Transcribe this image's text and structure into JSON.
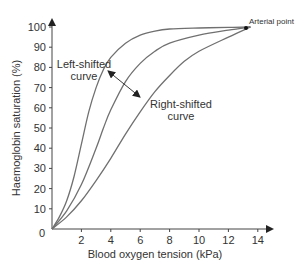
{
  "chart_data": {
    "type": "line",
    "title": "",
    "xlabel": "Blood oxygen tension (kPa)",
    "ylabel": "Haemoglobin saturation (%)",
    "xlim": [
      0,
      14
    ],
    "ylim": [
      0,
      100
    ],
    "x_ticks": [
      0,
      2,
      4,
      6,
      8,
      10,
      12,
      14
    ],
    "x_tick_labels": [
      "2",
      "4",
      "6",
      "8",
      "10",
      "12",
      "14"
    ],
    "y_ticks": [
      0,
      10,
      20,
      30,
      40,
      50,
      60,
      70,
      80,
      90,
      100
    ],
    "y_tick_labels": [
      "0",
      "10",
      "20",
      "30",
      "40",
      "50",
      "60",
      "70",
      "80",
      "90",
      "100"
    ],
    "grid": false,
    "legend": null,
    "series": [
      {
        "name": "Left-shifted curve",
        "x": [
          0,
          0.5,
          1,
          1.5,
          2,
          2.5,
          3,
          3.5,
          4,
          5,
          6,
          7,
          8,
          10,
          12,
          13.5
        ],
        "values": [
          0,
          6,
          14,
          26,
          42,
          58,
          70,
          79,
          85,
          92,
          96,
          98,
          99,
          99.5,
          99.8,
          100
        ]
      },
      {
        "name": "Normal curve",
        "x": [
          0,
          1,
          2,
          3,
          3.5,
          4,
          5,
          6,
          7,
          8,
          10,
          12,
          13.5
        ],
        "values": [
          0,
          9,
          22,
          40,
          50,
          59,
          73,
          82,
          88,
          92,
          96,
          98.5,
          100
        ]
      },
      {
        "name": "Right-shifted curve",
        "x": [
          0,
          1,
          2,
          3,
          4,
          5,
          6,
          7,
          8,
          9,
          10,
          12,
          13.5
        ],
        "values": [
          0,
          6,
          14,
          24,
          35,
          47,
          58,
          68,
          76,
          83,
          88,
          95,
          100
        ]
      }
    ],
    "annotations": [
      {
        "text": "Left-shifted curve",
        "points_to": "left curve"
      },
      {
        "text": "Right-shifted curve",
        "points_to": "right curve"
      },
      {
        "text": "Arterial point",
        "x": 13.3,
        "y": 100
      }
    ]
  },
  "labels": {
    "x_axis_title": "Blood oxygen tension (kPa)",
    "y_axis_title": "Haemoglobin saturation (%)",
    "left_shift_line1": "Left-shifted",
    "left_shift_line2": "curve",
    "right_shift_line1": "Right-shifted",
    "right_shift_line2": "curve",
    "arterial_point": "Arterial point",
    "origin": "0"
  },
  "colors": {
    "curve": "#707070",
    "axis": "#444444",
    "text": "#333333"
  }
}
